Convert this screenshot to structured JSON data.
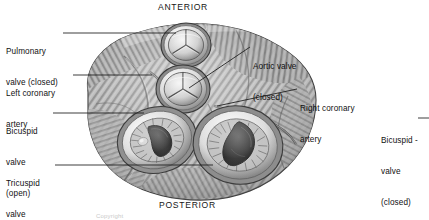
{
  "figure": {
    "title_orientation_top": "ANTERIOR",
    "title_orientation_bottom": "POSTERIOR",
    "caption_partial": "Copyright",
    "colors": {
      "background": "#ffffff",
      "text": "#111111",
      "leader_line": "#1a1a1a",
      "tissue_light": "#d8d8d8",
      "tissue_mid": "#9a9a9a",
      "tissue_dark": "#4a4a4a",
      "valve_opening": "#3a3a3a",
      "valve_ring": "#efefef"
    }
  },
  "labels": [
    {
      "id": "pulmonary-valve",
      "line1": "Pulmonary",
      "line2": "valve (closed)",
      "x": 6,
      "y": 28,
      "side": "left"
    },
    {
      "id": "left-coronary-artery",
      "line1": "Left coronary",
      "line2": "artery",
      "x": 6,
      "y": 70,
      "side": "left"
    },
    {
      "id": "bicuspid-valve-open",
      "line1": "Bicuspid",
      "line2": "valve",
      "line3": "(open)",
      "x": 6,
      "y": 108,
      "side": "left"
    },
    {
      "id": "tricuspid-valve-open",
      "line1": "Tricuspid",
      "line2": "valve",
      "line3": "(open)",
      "x": 6,
      "y": 160,
      "side": "left"
    },
    {
      "id": "aortic-valve",
      "line1": "Aortic valve",
      "line2": "(closed)",
      "x": 253,
      "y": 44,
      "side": "right"
    },
    {
      "id": "right-coronary-artery",
      "line1": "Right coronary",
      "line2": "artery",
      "x": 300,
      "y": 86,
      "side": "right"
    },
    {
      "id": "bicuspid-valve-closed",
      "line1": "Bicuspid -",
      "line2": "valve",
      "line3": "(closed)",
      "x": 381,
      "y": 118,
      "side": "far-right"
    }
  ],
  "valves": [
    {
      "id": "pulmonary-valve",
      "type": "semilunar",
      "state": "closed",
      "cx": 186,
      "cy": 45,
      "r": 23
    },
    {
      "id": "aortic-valve",
      "type": "semilunar",
      "state": "closed",
      "cx": 183,
      "cy": 89,
      "r": 25
    },
    {
      "id": "bicuspid-valve",
      "type": "atrioventricular",
      "state": "open",
      "cx": 157,
      "cy": 140,
      "rx": 39,
      "ry": 32
    },
    {
      "id": "tricuspid-valve",
      "type": "atrioventricular",
      "state": "open",
      "cx": 238,
      "cy": 145,
      "rx": 44,
      "ry": 38
    }
  ],
  "orientation": {
    "top": {
      "label": "ANTERIOR",
      "x": 158,
      "y": 2
    },
    "bottom": {
      "label": "POSTERIOR",
      "x": 159,
      "y": 200
    }
  }
}
